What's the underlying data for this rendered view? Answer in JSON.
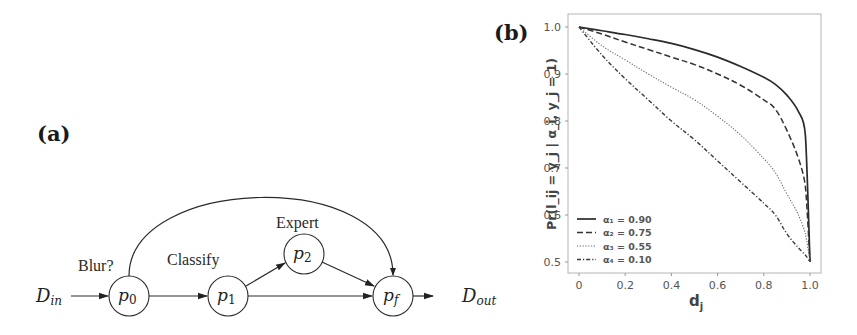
{
  "panel_a": {
    "label": "(a)",
    "input_label": {
      "base": "D",
      "sub": "in"
    },
    "output_label": {
      "base": "D",
      "sub": "out"
    },
    "nodes": [
      {
        "id": "p0",
        "base": "p",
        "sub": "0",
        "caption": "Blur?"
      },
      {
        "id": "p1",
        "base": "p",
        "sub": "1",
        "caption": "Classify"
      },
      {
        "id": "p2",
        "base": "p",
        "sub": "2",
        "caption": "Expert"
      },
      {
        "id": "pf",
        "base": "p",
        "sub": "f",
        "caption": ""
      }
    ],
    "edges": [
      {
        "from": "D_in",
        "to": "p0"
      },
      {
        "from": "p0",
        "to": "p1"
      },
      {
        "from": "p0",
        "to": "pf",
        "curved": true
      },
      {
        "from": "p1",
        "to": "p2"
      },
      {
        "from": "p1",
        "to": "pf"
      },
      {
        "from": "p2",
        "to": "pf"
      },
      {
        "from": "pf",
        "to": "D_out"
      }
    ]
  },
  "panel_b": {
    "label": "(b)",
    "ylabel": "Pr(l_ij = y_j | α_i, y_j = 1)",
    "xlabel": "d_j",
    "xticks": [
      "0",
      "0.2",
      "0.4",
      "0.6",
      "0.8",
      "1.0"
    ],
    "yticks": [
      "1.0",
      "0.9",
      "0.8",
      "0.7",
      "0.6",
      "0.5"
    ],
    "legend": [
      {
        "label": "α₁ = 0.90",
        "style": "solid"
      },
      {
        "label": "α₂ = 0.75",
        "style": "dashed"
      },
      {
        "label": "α₃ = 0.55",
        "style": "dotted"
      },
      {
        "label": "α₄ = 0.10",
        "style": "dashdot"
      }
    ]
  },
  "chart_data": {
    "type": "line",
    "title": "",
    "xlabel": "d_j",
    "ylabel": "Pr(l_ij = y_j | α_i, y_j = 1)",
    "xlim": [
      0,
      1.0
    ],
    "ylim": [
      0.5,
      1.0
    ],
    "grid": false,
    "legend_position": "lower left",
    "x": [
      0,
      0.1,
      0.2,
      0.3,
      0.4,
      0.5,
      0.6,
      0.7,
      0.8,
      0.85,
      0.9,
      0.95,
      0.98,
      1.0
    ],
    "series": [
      {
        "name": "α₁ = 0.90",
        "style": "solid",
        "values": [
          1.0,
          0.992,
          0.984,
          0.975,
          0.965,
          0.952,
          0.936,
          0.916,
          0.893,
          0.878,
          0.855,
          0.82,
          0.77,
          0.5
        ]
      },
      {
        "name": "α₂ = 0.75",
        "style": "dashed",
        "values": [
          1.0,
          0.985,
          0.968,
          0.952,
          0.936,
          0.92,
          0.9,
          0.876,
          0.845,
          0.825,
          0.78,
          0.72,
          0.66,
          0.5
        ]
      },
      {
        "name": "α₃ = 0.55",
        "style": "dotted",
        "values": [
          1.0,
          0.96,
          0.93,
          0.9,
          0.872,
          0.845,
          0.81,
          0.77,
          0.72,
          0.69,
          0.645,
          0.6,
          0.56,
          0.5
        ]
      },
      {
        "name": "α₄ = 0.10",
        "style": "dashdot",
        "values": [
          1.0,
          0.94,
          0.89,
          0.845,
          0.8,
          0.76,
          0.715,
          0.67,
          0.625,
          0.6,
          0.56,
          0.53,
          0.515,
          0.5
        ]
      }
    ]
  }
}
